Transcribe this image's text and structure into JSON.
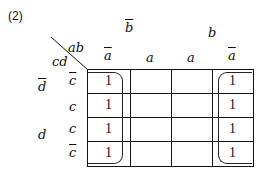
{
  "title": "(2)",
  "corner": {
    "top": "ab",
    "left": "cd"
  },
  "b_labels": [
    {
      "text": "b",
      "bar": true
    },
    {
      "text": "b",
      "bar": false
    }
  ],
  "a_labels": [
    {
      "text": "a",
      "bar": true
    },
    {
      "text": "a",
      "bar": false
    },
    {
      "text": "a",
      "bar": false
    },
    {
      "text": "a",
      "bar": true
    }
  ],
  "d_labels": [
    {
      "text": "d",
      "bar": true
    },
    {
      "text": "d",
      "bar": false
    }
  ],
  "c_labels": [
    {
      "text": "c",
      "bar": true
    },
    {
      "text": "c",
      "bar": false
    },
    {
      "text": "c",
      "bar": false
    },
    {
      "text": "c",
      "bar": true
    }
  ],
  "cells": [
    [
      "1",
      "",
      "",
      "1"
    ],
    [
      "1",
      "",
      "",
      "1"
    ],
    [
      "1",
      "",
      "",
      "1"
    ],
    [
      "1",
      "",
      "",
      "1"
    ]
  ],
  "groups": [
    {
      "name": "column-1-loop",
      "col": 0
    },
    {
      "name": "column-4-loop",
      "col": 3
    }
  ]
}
